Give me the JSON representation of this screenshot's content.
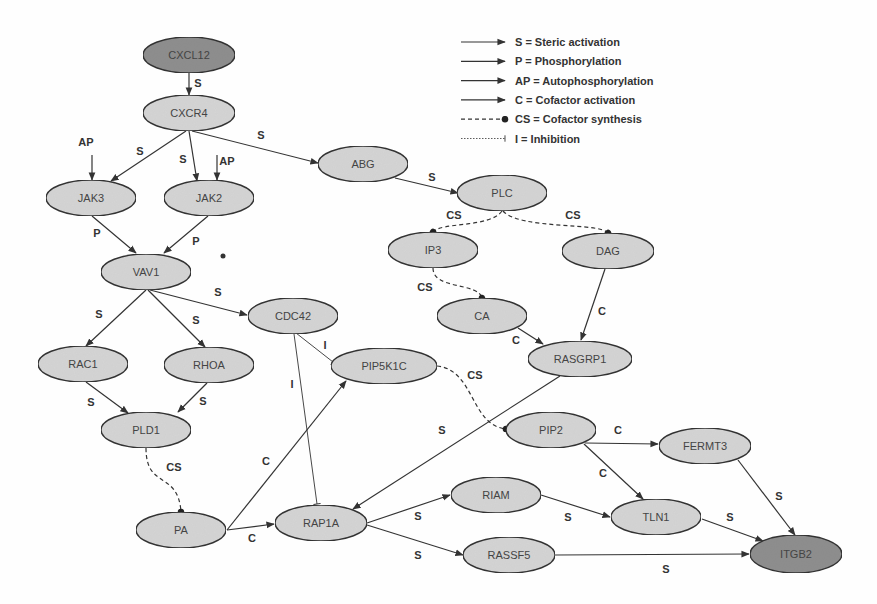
{
  "colors": {
    "node_fill": "#d4d4d4",
    "node_fill_dark": "#8e8e8e",
    "stroke": "#333333"
  },
  "legend": [
    {
      "type": "S",
      "text": "S = Steric activation",
      "style": "solid-arrow"
    },
    {
      "type": "P",
      "text": "P = Phosphorylation",
      "style": "solid-arrow"
    },
    {
      "type": "AP",
      "text": "AP = Autophosphorylation",
      "style": "solid-arrow"
    },
    {
      "type": "C",
      "text": "C = Cofactor activation",
      "style": "solid-arrow"
    },
    {
      "type": "CS",
      "text": "CS = Cofactor synthesis",
      "style": "dashed-dot"
    },
    {
      "type": "I",
      "text": "I = Inhibition",
      "style": "dotted-bar"
    }
  ],
  "nodes": [
    {
      "id": "CXCL12",
      "label": "CXCL12",
      "x": 189,
      "y": 55,
      "rx": 46,
      "ry": 18,
      "dark": true
    },
    {
      "id": "CXCR4",
      "label": "CXCR4",
      "x": 189,
      "y": 113,
      "rx": 46,
      "ry": 18
    },
    {
      "id": "JAK3",
      "label": "JAK3",
      "x": 91,
      "y": 198,
      "rx": 45,
      "ry": 18
    },
    {
      "id": "JAK2",
      "label": "JAK2",
      "x": 209,
      "y": 198,
      "rx": 45,
      "ry": 18
    },
    {
      "id": "ABG",
      "label": "ABG",
      "x": 363,
      "y": 164,
      "rx": 45,
      "ry": 18
    },
    {
      "id": "PLC",
      "label": "PLC",
      "x": 502,
      "y": 193,
      "rx": 45,
      "ry": 18
    },
    {
      "id": "IP3",
      "label": "IP3",
      "x": 433,
      "y": 250,
      "rx": 45,
      "ry": 18
    },
    {
      "id": "DAG",
      "label": "DAG",
      "x": 608,
      "y": 251,
      "rx": 46,
      "ry": 18
    },
    {
      "id": "VAV1",
      "label": "VAV1",
      "x": 146,
      "y": 272,
      "rx": 45,
      "ry": 18
    },
    {
      "id": "CDC42",
      "label": "CDC42",
      "x": 293,
      "y": 316,
      "rx": 45,
      "ry": 18
    },
    {
      "id": "CA",
      "label": "CA",
      "x": 482,
      "y": 316,
      "rx": 45,
      "ry": 18
    },
    {
      "id": "RAC1",
      "label": "RAC1",
      "x": 83,
      "y": 364,
      "rx": 45,
      "ry": 18
    },
    {
      "id": "RHOA",
      "label": "RHOA",
      "x": 209,
      "y": 365,
      "rx": 45,
      "ry": 18
    },
    {
      "id": "PIP5K1C",
      "label": "PIP5K1C",
      "x": 384,
      "y": 366,
      "rx": 53,
      "ry": 18
    },
    {
      "id": "RASGRP1",
      "label": "RASGRP1",
      "x": 580,
      "y": 359,
      "rx": 52,
      "ry": 18
    },
    {
      "id": "PLD1",
      "label": "PLD1",
      "x": 146,
      "y": 430,
      "rx": 45,
      "ry": 18
    },
    {
      "id": "PIP2",
      "label": "PIP2",
      "x": 551,
      "y": 430,
      "rx": 45,
      "ry": 18
    },
    {
      "id": "FERMT3",
      "label": "FERMT3",
      "x": 705,
      "y": 446,
      "rx": 46,
      "ry": 18
    },
    {
      "id": "RIAM",
      "label": "RIAM",
      "x": 496,
      "y": 495,
      "rx": 45,
      "ry": 18
    },
    {
      "id": "TLN1",
      "label": "TLN1",
      "x": 656,
      "y": 517,
      "rx": 45,
      "ry": 18
    },
    {
      "id": "PA",
      "label": "PA",
      "x": 181,
      "y": 530,
      "rx": 45,
      "ry": 18
    },
    {
      "id": "RAP1A",
      "label": "RAP1A",
      "x": 321,
      "y": 523,
      "rx": 46,
      "ry": 18
    },
    {
      "id": "RASSF5",
      "label": "RASSF5",
      "x": 509,
      "y": 555,
      "rx": 46,
      "ry": 18
    },
    {
      "id": "ITGB2",
      "label": "ITGB2",
      "x": 796,
      "y": 554,
      "rx": 46,
      "ry": 19,
      "dark": true
    }
  ],
  "edges": [
    {
      "from": "CXCL12",
      "to": "CXCR4",
      "label": "S",
      "style": "arrow",
      "path": "M189,73 L189,95",
      "lx": 198,
      "ly": 87
    },
    {
      "from": "CXCR4",
      "to": "JAK3",
      "label": "S",
      "style": "arrow",
      "path": "M186,131 L111,181",
      "lx": 140,
      "ly": 155
    },
    {
      "from": "CXCR4",
      "to": "JAK2",
      "label": "S",
      "style": "arrow",
      "path": "M189,131 L197,181",
      "lx": 183,
      "ly": 163
    },
    {
      "from": "CXCR4",
      "to": "ABG",
      "label": "S",
      "style": "arrow",
      "path": "M192,131 L318,163",
      "lx": 261,
      "ly": 139
    },
    {
      "from": "AP1",
      "to": "JAK3",
      "label": "AP",
      "style": "arrow",
      "path": "M92,155 L92,180",
      "lx": 86,
      "ly": 146
    },
    {
      "from": "AP2",
      "to": "JAK2",
      "label": "AP",
      "style": "arrow",
      "path": "M217,155 L217,180",
      "lx": 227,
      "ly": 165
    },
    {
      "from": "JAK3",
      "to": "VAV1",
      "label": "P",
      "style": "arrow",
      "path": "M92,216 L136,253",
      "lx": 97,
      "ly": 237
    },
    {
      "from": "JAK2",
      "to": "VAV1",
      "label": "P",
      "style": "arrow",
      "path": "M208,216 L164,253",
      "lx": 196,
      "ly": 245
    },
    {
      "from": "ABG",
      "to": "PLC",
      "label": "S",
      "style": "arrow",
      "path": "M395,178 L458,193",
      "lx": 432,
      "ly": 181
    },
    {
      "from": "PLC",
      "to": "IP3",
      "label": "CS",
      "style": "cs",
      "path": "M502,211 C490,228 440,222 433,232",
      "lx": 454,
      "ly": 219
    },
    {
      "from": "PLC",
      "to": "DAG",
      "label": "CS",
      "style": "cs",
      "path": "M503,211 C520,230 600,222 608,233",
      "lx": 573,
      "ly": 219
    },
    {
      "from": "IP3",
      "to": "CA",
      "label": "CS",
      "style": "cs",
      "path": "M433,268 C433,290 478,282 482,298",
      "lx": 425,
      "ly": 291
    },
    {
      "from": "DAG",
      "to": "RASGRP1",
      "label": "C",
      "style": "arrow",
      "path": "M605,269 L581,340",
      "lx": 602,
      "ly": 315
    },
    {
      "from": "CA",
      "to": "RASGRP1",
      "label": "C",
      "style": "arrow",
      "path": "M518,328 L543,344",
      "lx": 516,
      "ly": 344
    },
    {
      "from": "VAV1",
      "to": "RAC1",
      "label": "S",
      "style": "arrow",
      "path": "M146,290 L86,346",
      "lx": 99,
      "ly": 318
    },
    {
      "from": "VAV1",
      "to": "RHOA",
      "label": "S",
      "style": "arrow",
      "path": "M148,290 L205,347",
      "lx": 196,
      "ly": 324
    },
    {
      "from": "VAV1",
      "to": "CDC42",
      "label": "S",
      "style": "arrow",
      "path": "M150,290 L247,315",
      "lx": 218,
      "ly": 296
    },
    {
      "from": "CDC42",
      "to": "PIP5K1C",
      "label": "I",
      "style": "inhibit",
      "path": "M296,333 L333,362",
      "lx": 325,
      "ly": 349
    },
    {
      "from": "CDC42",
      "to": "RAP1A",
      "label": "I",
      "style": "inhibit",
      "path": "M294,334 L317,504",
      "lx": 292,
      "ly": 388
    },
    {
      "from": "RAC1",
      "to": "PLD1",
      "label": "S",
      "style": "arrow",
      "path": "M86,382 L128,413",
      "lx": 91,
      "ly": 406
    },
    {
      "from": "RHOA",
      "to": "PLD1",
      "label": "S",
      "style": "arrow",
      "path": "M207,383 L178,412",
      "lx": 203,
      "ly": 405
    },
    {
      "from": "PLD1",
      "to": "PA",
      "label": "CS",
      "style": "cs",
      "path": "M146,448 C146,490 178,470 181,512",
      "lx": 174,
      "ly": 471
    },
    {
      "from": "PA",
      "to": "PIP5K1C",
      "label": "C",
      "style": "arrow",
      "path": "M227,530 L346,381",
      "lx": 266,
      "ly": 465
    },
    {
      "from": "PA",
      "to": "RAP1A",
      "label": "C",
      "style": "arrow",
      "path": "M227,530 L274,524",
      "lx": 252,
      "ly": 542
    },
    {
      "from": "PIP5K1C",
      "to": "PIP2",
      "label": "CS",
      "style": "cs",
      "path": "M437,366 C475,370 470,425 506,429",
      "lx": 475,
      "ly": 379
    },
    {
      "from": "RASGRP1",
      "to": "RAP1A",
      "label": "S",
      "style": "arrow",
      "path": "M560,376 L353,509",
      "lx": 442,
      "ly": 434
    },
    {
      "from": "RAP1A",
      "to": "RIAM",
      "label": "S",
      "style": "arrow",
      "path": "M367,523 L450,495",
      "lx": 418,
      "ly": 520
    },
    {
      "from": "RAP1A",
      "to": "RASSF5",
      "label": "S",
      "style": "arrow",
      "path": "M367,525 L463,555",
      "lx": 418,
      "ly": 559
    },
    {
      "from": "PIP2",
      "to": "FERMT3",
      "label": "C",
      "style": "arrow",
      "path": "M585,443 L658,444",
      "lx": 618,
      "ly": 434
    },
    {
      "from": "PIP2",
      "to": "TLN1",
      "label": "C",
      "style": "arrow",
      "path": "M584,444 L643,499",
      "lx": 603,
      "ly": 477
    },
    {
      "from": "RIAM",
      "to": "TLN1",
      "label": "S",
      "style": "arrow",
      "path": "M541,495 L610,517",
      "lx": 568,
      "ly": 521
    },
    {
      "from": "TLN1",
      "to": "ITGB2",
      "label": "S",
      "style": "arrow",
      "path": "M702,519 L763,541",
      "lx": 730,
      "ly": 521
    },
    {
      "from": "FERMT3",
      "to": "ITGB2",
      "label": "S",
      "style": "arrow",
      "path": "M738,460 L795,535",
      "lx": 779,
      "ly": 500
    },
    {
      "from": "RASSF5",
      "to": "ITGB2",
      "label": "S",
      "style": "arrow",
      "path": "M555,555 L749,554",
      "lx": 666,
      "ly": 573
    }
  ]
}
